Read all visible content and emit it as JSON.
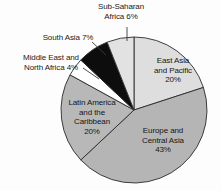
{
  "chart_data": {
    "type": "pie",
    "title": "",
    "subtitle": "",
    "xlabel": "",
    "ylabel": "",
    "legend_position": "none",
    "grid": false,
    "units": "percent",
    "start_angle_deg": 0,
    "direction": "clockwise",
    "categories": [
      "East Asia and Pacific",
      "Europe and Central Asia",
      "Latin America and the Caribbean",
      "Middle East and North Africa",
      "South Asia",
      "Sub-Saharan Africa"
    ],
    "values": [
      20,
      43,
      20,
      4,
      7,
      6
    ],
    "slices": [
      {
        "name": "East Asia and Pacific",
        "value": 20,
        "percent_text": "20%",
        "color": "#dedede",
        "label_lines": [
          "East Asia",
          "and Pacific",
          "20%"
        ],
        "label_placement": "inside"
      },
      {
        "name": "Europe and Central Asia",
        "value": 43,
        "percent_text": "43%",
        "color": "#b5b5b5",
        "label_lines": [
          "Europe and",
          "Central Asia",
          "43%"
        ],
        "label_placement": "inside"
      },
      {
        "name": "Latin America and the Caribbean",
        "value": 20,
        "percent_text": "20%",
        "color": "#b8b8b8",
        "label_lines": [
          "Latin America",
          "and the",
          "Caribbean",
          "20%"
        ],
        "label_placement": "inside"
      },
      {
        "name": "Middle East and North Africa",
        "value": 4,
        "percent_text": "4%",
        "color": "#ffffff",
        "label_lines": [
          "Middle East and",
          "North Africa 4%"
        ],
        "label_placement": "outside"
      },
      {
        "name": "South Asia",
        "value": 7,
        "percent_text": "7%",
        "color": "#0d0d0d",
        "label_lines": [
          "South Asia 7%"
        ],
        "label_placement": "outside"
      },
      {
        "name": "Sub-Saharan Africa",
        "value": 6,
        "percent_text": "6%",
        "color": "#e2e2e2",
        "label_lines": [
          "Sub-Saharan",
          "Africa 6%"
        ],
        "label_placement": "outside"
      }
    ]
  },
  "labels": {
    "sub_saharan_africa": {
      "line1": "Sub-Saharan",
      "line2": "Africa 6%"
    },
    "south_asia": {
      "line1": "South Asia 7%"
    },
    "middle_east": {
      "line1": "Middle East and",
      "line2": "North Africa 4%"
    },
    "east_asia": {
      "line1": "East Asia",
      "line2": "and Pacific",
      "line3": "20%"
    },
    "europe_central_asia": {
      "line1": "Europe and",
      "line2": "Central Asia",
      "line3": "43%"
    },
    "latin_america": {
      "line1": "Latin America",
      "line2": "and the",
      "line3": "Caribbean",
      "line4": "20%"
    }
  },
  "colors": {
    "outline": "#2b2b2b",
    "leader_line": "#3a3a3a",
    "text": "#161616",
    "background": "#fdfdfd"
  }
}
